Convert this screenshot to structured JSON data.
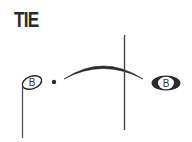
{
  "title": "TIE",
  "notation": {
    "left_note": {
      "type": "half-note",
      "letter": "B",
      "stem_direction": "down",
      "dotted": true
    },
    "right_note": {
      "type": "whole-note",
      "letter": "B"
    },
    "tie": {
      "direction": "over",
      "connects": [
        "left_note",
        "right_note"
      ]
    },
    "barline": true
  },
  "colors": {
    "ink": "#2a2a2a",
    "background": "#ffffff"
  }
}
